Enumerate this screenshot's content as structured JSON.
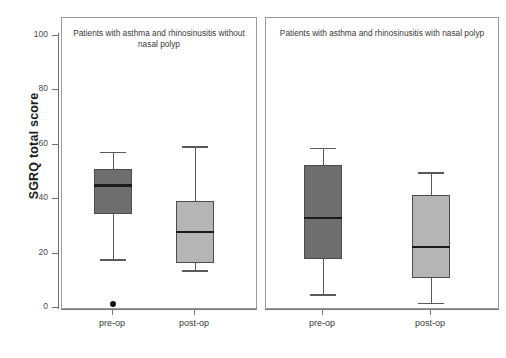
{
  "chart_data": {
    "type": "box",
    "title": "",
    "xlabel": "",
    "ylabel": "SGRQ total score",
    "ylim": [
      0,
      100
    ],
    "yticks": [
      0,
      20,
      40,
      60,
      80,
      100
    ],
    "ytick_labels": [
      "0",
      "20",
      "40",
      "60",
      "80",
      "100"
    ],
    "grid": false,
    "legend": "none",
    "panels": [
      {
        "id": "panel-left",
        "title": "Patients with asthma and rhinosinusitis without nasal polyp",
        "categories": [
          "pre-op",
          "post-op"
        ],
        "boxes": [
          {
            "label": "pre-op",
            "fill": "#6e6e6e",
            "whisker_low": 18,
            "q1": 34.5,
            "median": 45,
            "q3": 51,
            "whisker_high": 57.5,
            "outliers": [
              1.5
            ]
          },
          {
            "label": "post-op",
            "fill": "#b5b5b5",
            "whisker_low": 14,
            "q1": 16.5,
            "median": 28,
            "q3": 39.5,
            "whisker_high": 59.5,
            "outliers": []
          }
        ]
      },
      {
        "id": "panel-right",
        "title": "Patients with asthma and rhinosinusitis with nasal polyp",
        "categories": [
          "pre-op",
          "post-op"
        ],
        "boxes": [
          {
            "label": "pre-op",
            "fill": "#6e6e6e",
            "whisker_low": 5,
            "q1": 18,
            "median": 33,
            "q3": 52.5,
            "whisker_high": 59,
            "outliers": []
          },
          {
            "label": "post-op",
            "fill": "#b5b5b5",
            "whisker_low": 2,
            "q1": 11,
            "median": 22.5,
            "q3": 41.5,
            "whisker_high": 50,
            "outliers": []
          }
        ]
      }
    ]
  },
  "axis": {
    "y_title": "SGRQ total score"
  }
}
